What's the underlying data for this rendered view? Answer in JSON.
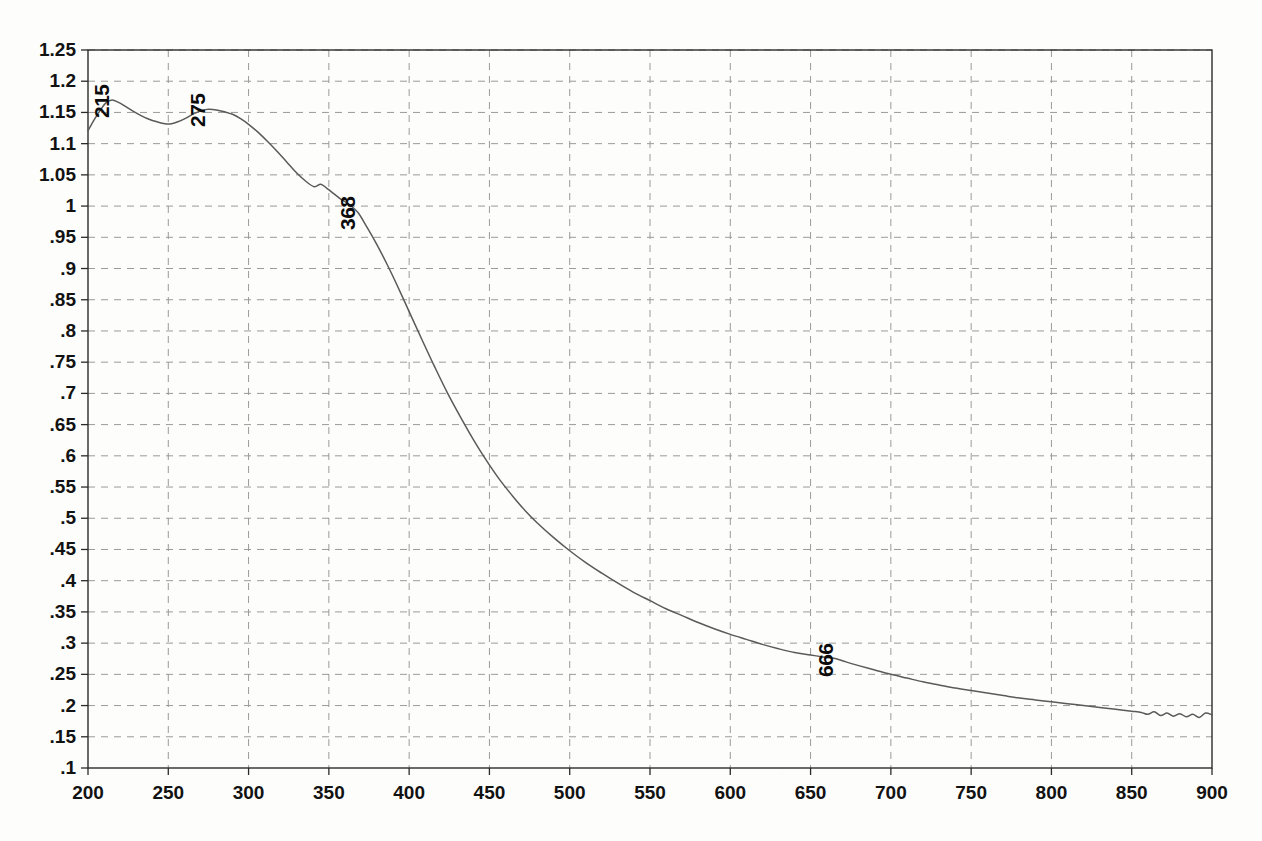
{
  "chart_data": {
    "type": "line",
    "title": "",
    "xlabel": "",
    "ylabel": "",
    "xlim": [
      200,
      900
    ],
    "ylim": [
      0.1,
      1.25
    ],
    "grid": true,
    "legend": "none",
    "x_ticks": [
      200,
      250,
      300,
      350,
      400,
      450,
      500,
      550,
      600,
      650,
      700,
      750,
      800,
      850,
      900
    ],
    "x_tick_labels": [
      "200",
      "250",
      "300",
      "350",
      "400",
      "450",
      "500",
      "550",
      "600",
      "650",
      "700",
      "750",
      "800",
      "850",
      "900"
    ],
    "y_ticks": [
      0.1,
      0.15,
      0.2,
      0.25,
      0.3,
      0.35,
      0.4,
      0.45,
      0.5,
      0.55,
      0.6,
      0.65,
      0.7,
      0.75,
      0.8,
      0.85,
      0.9,
      0.95,
      1.0,
      1.05,
      1.1,
      1.15,
      1.2,
      1.25
    ],
    "y_tick_labels": [
      ".1",
      ".15",
      ".2",
      ".25",
      ".3",
      ".35",
      ".4",
      ".45",
      ".5",
      ".55",
      ".6",
      ".65",
      ".7",
      ".75",
      ".8",
      ".85",
      ".9",
      ".95",
      "1",
      "1.05",
      "1.1",
      "1.15",
      "1.2",
      "1.25"
    ],
    "series": [
      {
        "name": "absorbance",
        "color": "#5a5a5a",
        "x": [
          200,
          204,
          208,
          211,
          215,
          219,
          223,
          228,
          233,
          238,
          243,
          248,
          252,
          256,
          261,
          266,
          271,
          275,
          280,
          285,
          290,
          295,
          300,
          306,
          312,
          318,
          324,
          330,
          336,
          341,
          345,
          349,
          353,
          358,
          362,
          368,
          374,
          380,
          386,
          392,
          400,
          408,
          416,
          424,
          432,
          440,
          448,
          456,
          464,
          472,
          480,
          490,
          500,
          510,
          520,
          530,
          540,
          550,
          560,
          570,
          580,
          590,
          600,
          610,
          620,
          630,
          640,
          650,
          660,
          666,
          672,
          680,
          690,
          700,
          710,
          720,
          730,
          740,
          750,
          760,
          770,
          780,
          790,
          800,
          810,
          820,
          830,
          840,
          850,
          856,
          860,
          864,
          868,
          872,
          876,
          880,
          884,
          888,
          892,
          896,
          900
        ],
        "y": [
          1.121,
          1.139,
          1.155,
          1.165,
          1.17,
          1.166,
          1.16,
          1.152,
          1.145,
          1.139,
          1.135,
          1.132,
          1.132,
          1.135,
          1.141,
          1.148,
          1.153,
          1.155,
          1.154,
          1.151,
          1.147,
          1.14,
          1.131,
          1.118,
          1.103,
          1.087,
          1.07,
          1.053,
          1.039,
          1.031,
          1.035,
          1.028,
          1.02,
          1.01,
          1.004,
          0.99,
          0.965,
          0.938,
          0.908,
          0.876,
          0.831,
          0.786,
          0.742,
          0.7,
          0.662,
          0.626,
          0.593,
          0.563,
          0.537,
          0.513,
          0.492,
          0.469,
          0.448,
          0.429,
          0.412,
          0.396,
          0.381,
          0.368,
          0.355,
          0.344,
          0.333,
          0.323,
          0.314,
          0.306,
          0.298,
          0.291,
          0.285,
          0.281,
          0.277,
          0.275,
          0.27,
          0.264,
          0.257,
          0.25,
          0.244,
          0.238,
          0.233,
          0.228,
          0.224,
          0.22,
          0.216,
          0.212,
          0.209,
          0.206,
          0.203,
          0.2,
          0.197,
          0.194,
          0.191,
          0.189,
          0.186,
          0.19,
          0.184,
          0.188,
          0.183,
          0.187,
          0.182,
          0.186,
          0.181,
          0.188,
          0.185
        ]
      }
    ],
    "annotations": [
      {
        "label": "215",
        "x": 215,
        "y": 1.17,
        "rotation": -90
      },
      {
        "label": "275",
        "x": 275,
        "y": 1.155,
        "rotation": -90
      },
      {
        "label": "368",
        "x": 368,
        "y": 0.99,
        "rotation": -90
      },
      {
        "label": "666",
        "x": 666,
        "y": 0.275,
        "rotation": -90
      }
    ]
  },
  "style": {
    "frame_color": "#2b2b2b",
    "grid_color": "#9a9a9a",
    "curve_color": "#5a5a5a",
    "background": "#fdfdfb",
    "label_color": "#121212"
  }
}
